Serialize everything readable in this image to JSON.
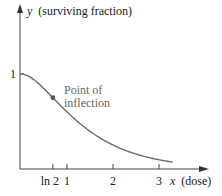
{
  "chart_data": {
    "type": "line",
    "title": "",
    "xlabel_var": "x",
    "xlabel_desc": "(dose)",
    "ylabel_var": "y",
    "ylabel_desc": "(surviving fraction)",
    "function": "y = 2e^{-x} - e^{-2x}",
    "x_ticks": [
      {
        "label": "ln 2",
        "value": 0.693
      },
      {
        "label": "1",
        "value": 1
      },
      {
        "label": "2",
        "value": 2
      },
      {
        "label": "3",
        "value": 3
      }
    ],
    "y_ticks": [
      {
        "label": "1",
        "value": 1
      }
    ],
    "x_range": [
      0,
      3.3
    ],
    "y_range": [
      0,
      1
    ],
    "series": [
      {
        "name": "surviving fraction",
        "x": [
          0,
          0.25,
          0.5,
          0.693,
          1,
          1.5,
          2,
          2.5,
          3,
          3.3
        ],
        "y": [
          1.0,
          0.951,
          0.845,
          0.75,
          0.6,
          0.397,
          0.252,
          0.157,
          0.097,
          0.072
        ]
      }
    ],
    "annotations": [
      {
        "text": "Point of",
        "line2": "inflection",
        "x": 0.693,
        "y": 0.75
      }
    ],
    "grid": false,
    "legend": "none"
  }
}
